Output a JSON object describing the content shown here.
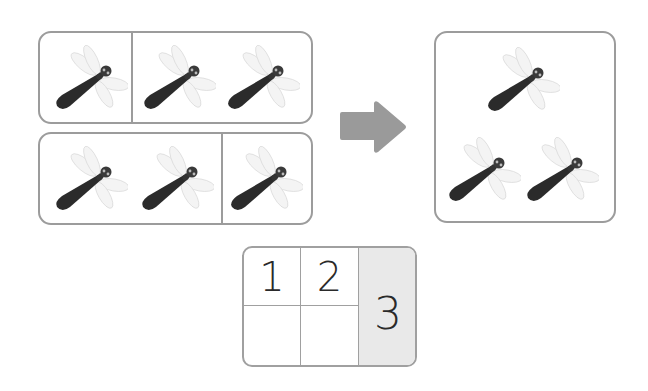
{
  "left_panel": {
    "top_group": {
      "left_count": 1,
      "right_count": 2
    },
    "bottom_group": {
      "left_count": 2,
      "right_count": 1
    },
    "icon": "dragonfly-icon"
  },
  "arrow": {
    "icon": "right-arrow-icon",
    "color": "#9a9a9a"
  },
  "right_panel": {
    "count": 3,
    "icon": "dragonfly-icon"
  },
  "number_table": {
    "cells": [
      "1",
      "2",
      "",
      "",
      "3"
    ],
    "shaded_color": "#e9e9e9"
  },
  "colors": {
    "border": "#9c9c9c",
    "dragonfly_body": "#2b2b2b",
    "wing": "#e6e6e6"
  }
}
